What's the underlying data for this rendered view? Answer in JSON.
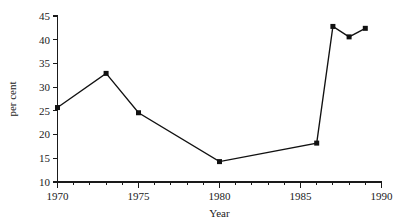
{
  "chart_data": {
    "type": "line",
    "title": "",
    "subtitle": "",
    "xlabel": "Year",
    "ylabel": "per cent",
    "xlim": [
      1970,
      1990
    ],
    "ylim": [
      10,
      45
    ],
    "xticks": [
      1970,
      1975,
      1980,
      1985,
      1990
    ],
    "xtick_labels": [
      "1970",
      "1975",
      "1980",
      "1985",
      "1990"
    ],
    "xminor_ticks": [
      1971,
      1972,
      1973,
      1974,
      1976,
      1977,
      1978,
      1979,
      1981,
      1982,
      1983,
      1984,
      1986,
      1987,
      1988,
      1989
    ],
    "yticks": [
      10,
      15,
      20,
      25,
      30,
      35,
      40,
      45
    ],
    "ytick_labels": [
      "10",
      "15",
      "20",
      "25",
      "30",
      "35",
      "40",
      "45"
    ],
    "grid": false,
    "legend": null,
    "legend_position": "none",
    "marker": "square",
    "line_color": "#111111",
    "marker_color": "#111111",
    "background_color": "#ffffff",
    "x": [
      1970,
      1973,
      1975,
      1980,
      1986,
      1987,
      1988,
      1989
    ],
    "values": [
      25.7,
      32.9,
      24.6,
      14.3,
      18.2,
      42.8,
      40.6,
      42.4
    ],
    "series": [
      {
        "name": "per cent",
        "x": [
          1970,
          1973,
          1975,
          1980,
          1986,
          1987,
          1988,
          1989
        ],
        "values": [
          25.7,
          32.9,
          24.6,
          14.3,
          18.2,
          42.8,
          40.6,
          42.4
        ]
      }
    ],
    "annotations": []
  }
}
